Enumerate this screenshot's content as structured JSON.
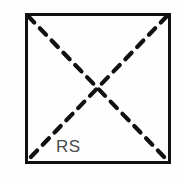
{
  "figure": {
    "background_color": "#fefefe",
    "canvas": {
      "width": 182,
      "height": 186
    },
    "square": {
      "name": "square-outline",
      "stroke_color": "#111111",
      "stroke_width": 3,
      "fill": "none",
      "left": 26,
      "top": 14,
      "right": 169,
      "bottom": 162
    },
    "diagonals": {
      "stroke_color": "#111111",
      "stroke_width": 4.2,
      "dash_length": 9,
      "dash_gap": 8,
      "intersection": {
        "x": 97,
        "y": 88
      },
      "lines": [
        {
          "name": "diagonal-top-left-to-bottom-right",
          "x1": 28,
          "y1": 16,
          "x2": 167,
          "y2": 160
        },
        {
          "name": "diagonal-top-right-to-bottom-left",
          "x1": 167,
          "y1": 16,
          "x2": 28,
          "y2": 160
        }
      ]
    },
    "labels": [
      {
        "name": "rs-label",
        "text": "RS",
        "color": "#4a4a4a",
        "font_size": 17,
        "x": 56,
        "y": 138
      }
    ]
  }
}
